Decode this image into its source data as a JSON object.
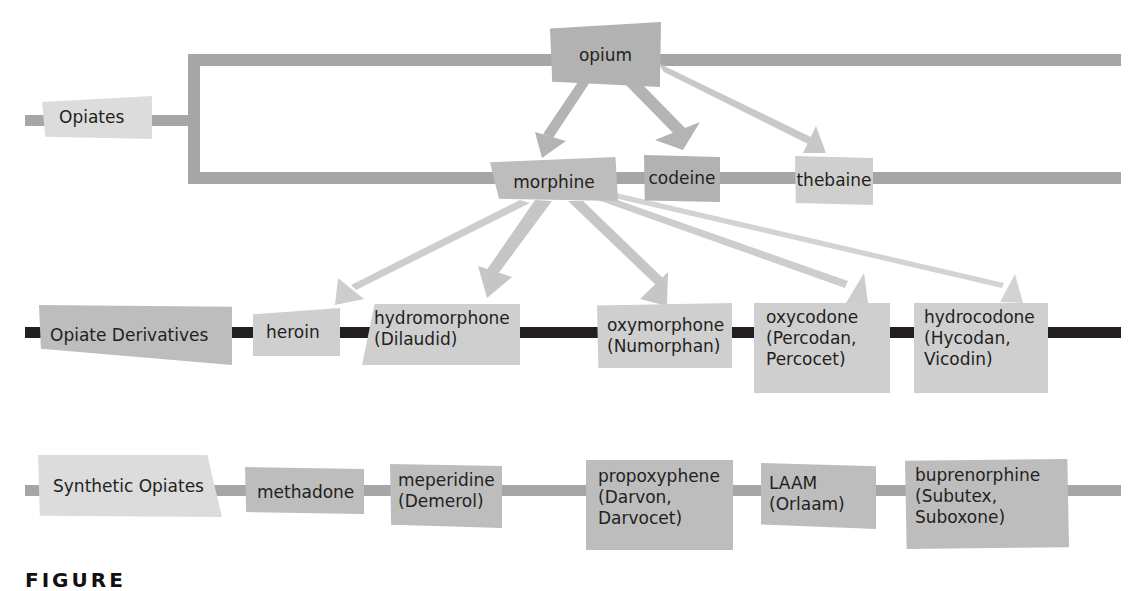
{
  "diagram": {
    "root": {
      "label": "Opiates"
    },
    "natural": {
      "source": {
        "label": "opium"
      },
      "alkaloids": [
        {
          "label": "morphine"
        },
        {
          "label": "codeine"
        },
        {
          "label": "thebaine"
        }
      ]
    },
    "derivatives": {
      "category": {
        "label": "Opiate Derivatives"
      },
      "items": [
        {
          "label": "heroin"
        },
        {
          "label": "hydromorphone\n(Dilaudid)"
        },
        {
          "label": "oxymorphone\n(Numorphan)"
        },
        {
          "label": "oxycodone\n(Percodan,\nPercocet)"
        },
        {
          "label": "hydrocodone\n(Hycodan,\nVicodin)"
        }
      ]
    },
    "synthetic": {
      "category": {
        "label": "Synthetic Opiates"
      },
      "items": [
        {
          "label": "methadone"
        },
        {
          "label": "meperidine\n(Demerol)"
        },
        {
          "label": "propoxyphene\n(Darvon,\nDarvocet)"
        },
        {
          "label": "LAAM\n(Orlaam)"
        },
        {
          "label": "buprenorphine\n(Subutex,\nSuboxone)"
        }
      ]
    },
    "edges": [
      {
        "from": "opium",
        "to": "morphine"
      },
      {
        "from": "opium",
        "to": "codeine"
      },
      {
        "from": "opium",
        "to": "thebaine"
      },
      {
        "from": "morphine",
        "to": "heroin"
      },
      {
        "from": "morphine",
        "to": "hydromorphone"
      },
      {
        "from": "morphine",
        "to": "oxymorphone"
      },
      {
        "from": "morphine",
        "to": "oxycodone"
      },
      {
        "from": "morphine",
        "to": "hydrocodone"
      }
    ],
    "caption_partial": "FIGURE",
    "colors": {
      "line_gray": "#a6a6a6",
      "line_dark": "#231f20",
      "node_dark": "#b2b2b2",
      "node_light": "#d4d4d4",
      "arrow": "#c8c8c8"
    }
  }
}
